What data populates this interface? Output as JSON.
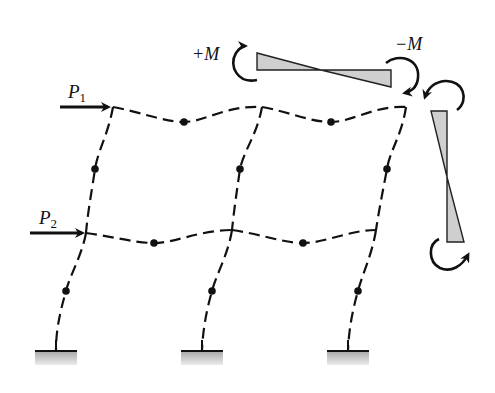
{
  "diagram": {
    "type": "portal-frame-deflection",
    "loads": [
      {
        "symbol": "P",
        "subscript": "1",
        "level": "top"
      },
      {
        "symbol": "P",
        "subscript": "2",
        "level": "lower"
      }
    ],
    "moments": {
      "positive_label": "+M",
      "negative_label": "−M"
    },
    "colors": {
      "line": "#111111",
      "moment_fill": "#cfcfcf",
      "support_fill_top": "#a8a8a8",
      "support_fill_bottom": "#e8e8e8"
    },
    "supports": [
      "fixed-left",
      "fixed-middle",
      "fixed-right"
    ],
    "inflection_points_count": 10
  }
}
